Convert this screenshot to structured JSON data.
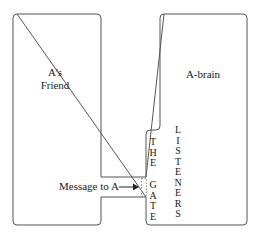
{
  "diagram": {
    "type": "block-diagram",
    "left_box": {
      "label_line1": "A’s",
      "label_line2": "Friend"
    },
    "right_box": {
      "label": "A-brain"
    },
    "gate": {
      "label_top": [
        "T",
        "H",
        "E"
      ],
      "label_bottom": [
        "G",
        "A",
        "T",
        "E"
      ]
    },
    "listeners": {
      "letters": [
        "L",
        "I",
        "S",
        "T",
        "E",
        "N",
        "E",
        "R",
        "S"
      ]
    },
    "arrow": {
      "label": "Message to A"
    },
    "colors": {
      "stroke": "#555555",
      "text": "#1a1a1a",
      "background": "#ffffff"
    }
  }
}
